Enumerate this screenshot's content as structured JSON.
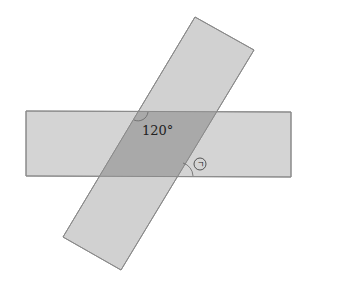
{
  "diagram": {
    "shapes": [
      {
        "name": "horizontal-strip",
        "fill": "#d4d4d4",
        "stroke": "#8a8a8a"
      },
      {
        "name": "tilted-strip",
        "fill": "#cfcfcf",
        "stroke": "#8a8a8a"
      }
    ],
    "overlap_fill": "#a9a9a9",
    "angle_label": "120°",
    "unknown_angle_label": "ㄱ"
  }
}
